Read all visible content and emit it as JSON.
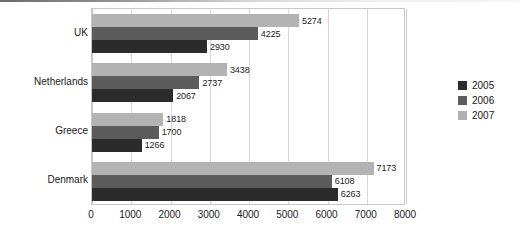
{
  "chart_data": {
    "type": "bar",
    "orientation": "horizontal",
    "title": "",
    "xlabel": "",
    "ylabel": "",
    "categories": [
      "UK",
      "Netherlands",
      "Greece",
      "Denmark"
    ],
    "series": [
      {
        "name": "2005",
        "color": "#2b2b2b",
        "values": [
          2930,
          2067,
          1266,
          6263
        ]
      },
      {
        "name": "2006",
        "color": "#5c5c5c",
        "values": [
          4225,
          2737,
          1700,
          6108
        ]
      },
      {
        "name": "2007",
        "color": "#b3b3b3",
        "values": [
          5274,
          3438,
          1818,
          7173
        ]
      }
    ],
    "series_draw_order_top_to_bottom": [
      "2007",
      "2006",
      "2005"
    ],
    "xlim": [
      0,
      8000
    ],
    "xticks": [
      0,
      1000,
      2000,
      3000,
      4000,
      5000,
      6000,
      7000,
      8000
    ],
    "xtick_labels": [
      "0",
      "1000",
      "2000",
      "3000",
      "4000",
      "5000",
      "6000",
      "7000",
      "8000"
    ],
    "grid": "vertical",
    "data_labels": true,
    "legend": {
      "position": "right",
      "entries": [
        {
          "label": "2005",
          "color": "#2b2b2b"
        },
        {
          "label": "2006",
          "color": "#5c5c5c"
        },
        {
          "label": "2007",
          "color": "#b3b3b3"
        }
      ]
    },
    "colors": {
      "plot_border": "#c8c8c8",
      "gridline": "#d8d8d8",
      "text": "#1a1a1a",
      "background": "#ffffff"
    }
  }
}
